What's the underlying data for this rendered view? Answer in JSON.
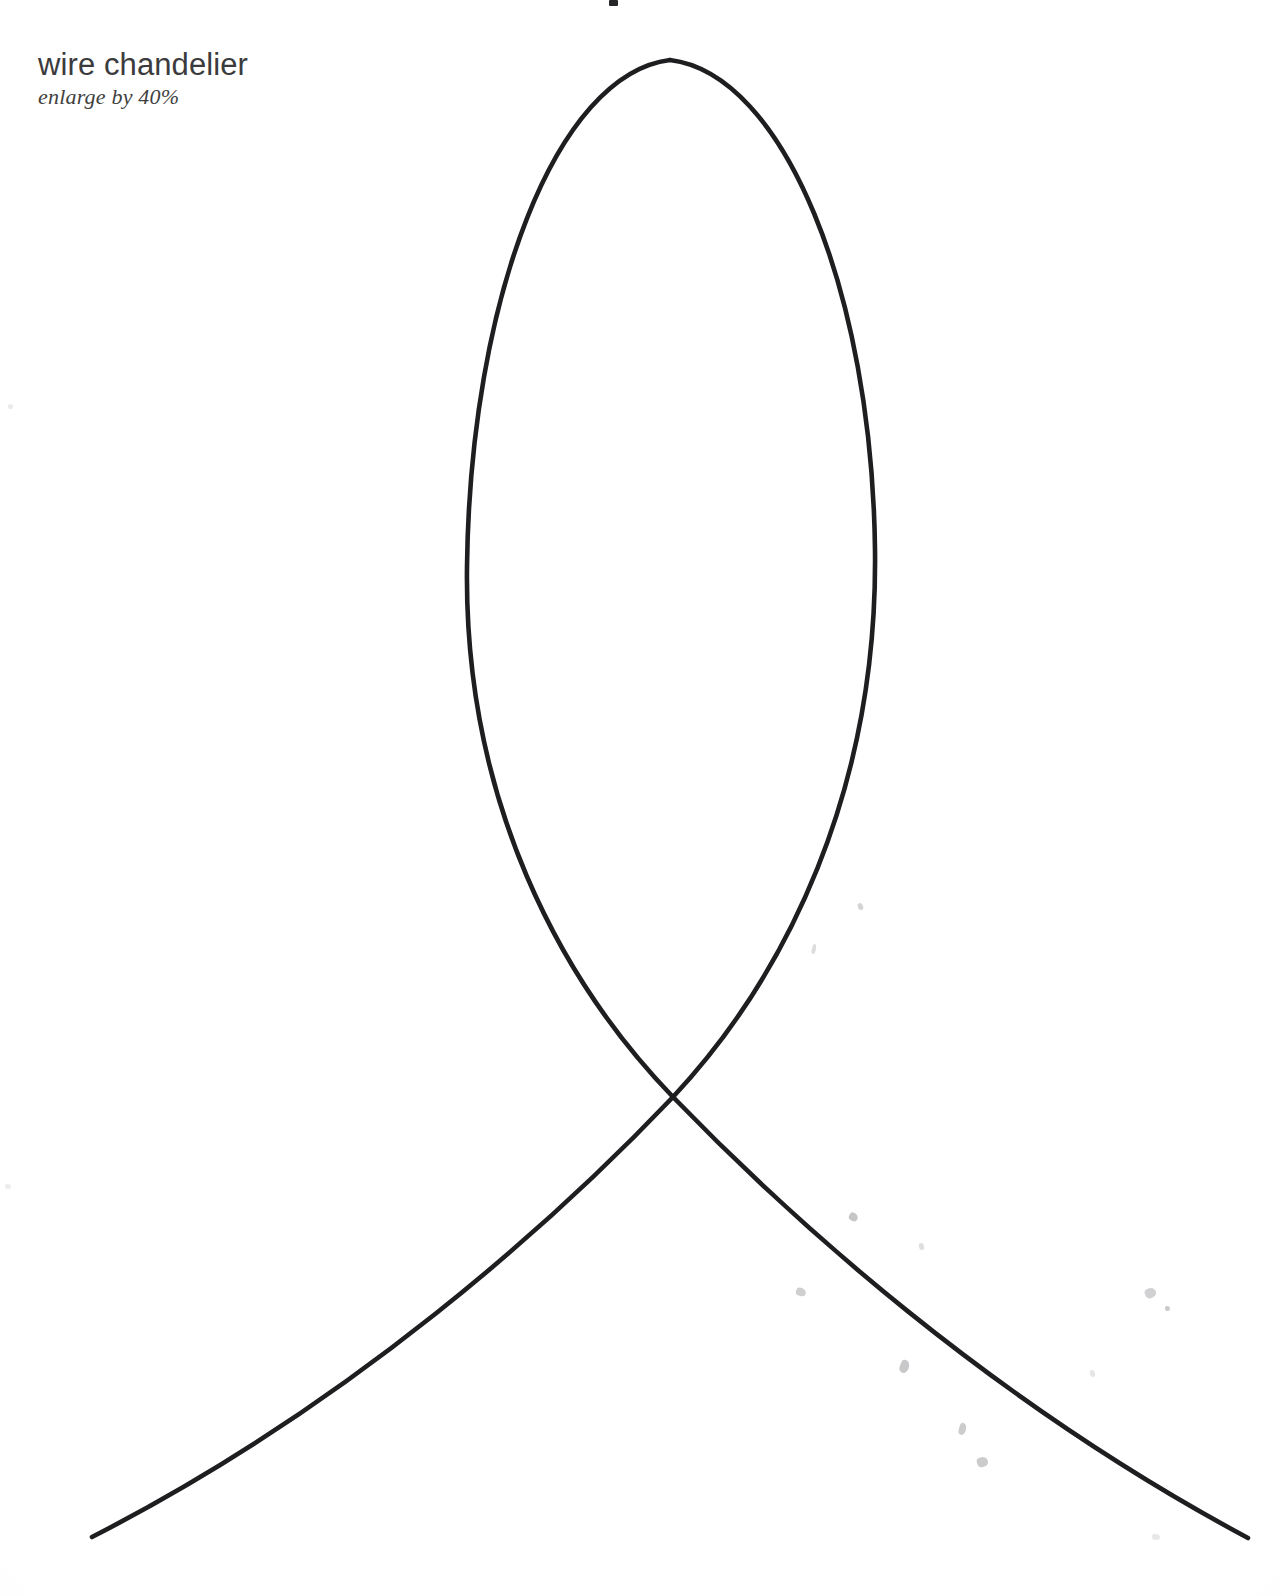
{
  "page": {
    "width": 1282,
    "height": 1596,
    "background_color": "#fefefe",
    "paper_tint": "#f6f6f5"
  },
  "caption": {
    "title": "wire chandelier",
    "subtitle": "enlarge by 40%",
    "title_color": "#3b3b3d",
    "subtitle_color": "#3f3f41",
    "position": {
      "x": 38,
      "y": 48
    }
  },
  "top_crop_fragment": {
    "description": "cropped-letter-fragment",
    "x": 609,
    "y": 0,
    "width": 9,
    "height": 6,
    "color": "#262628"
  },
  "artwork": {
    "name": "wire-chandelier-loop-template",
    "stroke_color": "#1e1e20",
    "stroke_width": 4.6,
    "apex": {
      "x": 670,
      "y": 60
    },
    "crossing_point": {
      "x": 673,
      "y": 1097
    },
    "loop_left_extreme": {
      "x": 467,
      "y": 567
    },
    "loop_right_extreme": {
      "x": 875,
      "y": 550
    },
    "left_tail_end": {
      "x": 92,
      "y": 1537
    },
    "right_tail_end": {
      "x": 1248,
      "y": 1538
    },
    "strokes": [
      {
        "name": "left-loop-to-right-tail",
        "path": "M 670 60 C 556 74, 470 300, 467 567 C 464 800, 560 980, 673 1097 C 790 1218, 990 1400, 1248 1538"
      },
      {
        "name": "right-loop-to-left-tail",
        "path": "M 670 60 C 784 74, 872 292, 875 550 C 878 790, 786 976, 673 1097 C 556 1220, 352 1404, 92 1537"
      }
    ]
  },
  "smudges": [
    {
      "x": 858,
      "y": 903,
      "w": 5,
      "h": 7,
      "r": -20,
      "o": 0.38
    },
    {
      "x": 812,
      "y": 944,
      "w": 4,
      "h": 10,
      "r": 12,
      "o": 0.3
    },
    {
      "x": 849,
      "y": 1213,
      "w": 9,
      "h": 8,
      "r": 30,
      "o": 0.5
    },
    {
      "x": 919,
      "y": 1243,
      "w": 5,
      "h": 7,
      "r": -10,
      "o": 0.28
    },
    {
      "x": 796,
      "y": 1288,
      "w": 10,
      "h": 8,
      "r": 18,
      "o": 0.42
    },
    {
      "x": 1145,
      "y": 1288,
      "w": 11,
      "h": 10,
      "r": -25,
      "o": 0.4
    },
    {
      "x": 1165,
      "y": 1306,
      "w": 5,
      "h": 5,
      "r": 0,
      "o": 0.46
    },
    {
      "x": 900,
      "y": 1360,
      "w": 9,
      "h": 13,
      "r": 22,
      "o": 0.48
    },
    {
      "x": 1090,
      "y": 1370,
      "w": 5,
      "h": 7,
      "r": -14,
      "o": 0.22
    },
    {
      "x": 959,
      "y": 1423,
      "w": 7,
      "h": 12,
      "r": 16,
      "o": 0.45
    },
    {
      "x": 977,
      "y": 1457,
      "w": 11,
      "h": 10,
      "r": -18,
      "o": 0.46
    },
    {
      "x": 1152,
      "y": 1534,
      "w": 8,
      "h": 6,
      "r": 8,
      "o": 0.2
    },
    {
      "x": 8,
      "y": 404,
      "w": 5,
      "h": 5,
      "r": 0,
      "o": 0.18
    },
    {
      "x": 5,
      "y": 1184,
      "w": 6,
      "h": 5,
      "r": 0,
      "o": 0.16
    }
  ]
}
